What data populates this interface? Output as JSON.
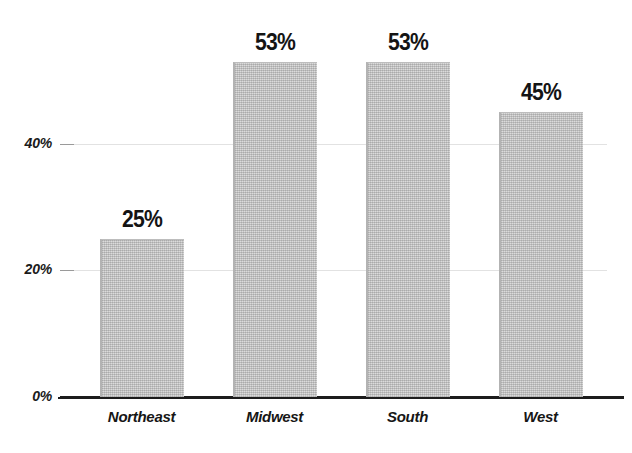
{
  "page": {
    "background_color": "#ffffff",
    "width": 632,
    "height": 453,
    "top_clipped_text": "                                                                                                    "
  },
  "style": {
    "bar_fill_color": "#c9c9c9",
    "bar_edge_color": "#b3b3b3",
    "axis_color": "#1c1c1c",
    "gridline_color": "#e2e2e2",
    "text_color": "#141414"
  },
  "chart_data": {
    "type": "bar",
    "title": "",
    "subtitle": "",
    "xlabel": "",
    "ylabel": "",
    "categories": [
      "Northeast",
      "Midwest",
      "South",
      "West"
    ],
    "values": [
      25,
      53,
      53,
      45
    ],
    "value_labels": [
      "25%",
      "53%",
      "53%",
      "45%"
    ],
    "ylim": [
      0,
      60
    ],
    "yticks": [
      0,
      20,
      40
    ],
    "ytick_labels": [
      "0%",
      "20%",
      "40%"
    ],
    "grid": true,
    "grid_axis": "y",
    "legend": false,
    "legend_position": "none",
    "orientation": "vertical",
    "series": [
      {
        "name": "Percent",
        "values": [
          25,
          53,
          53,
          45
        ]
      }
    ]
  }
}
